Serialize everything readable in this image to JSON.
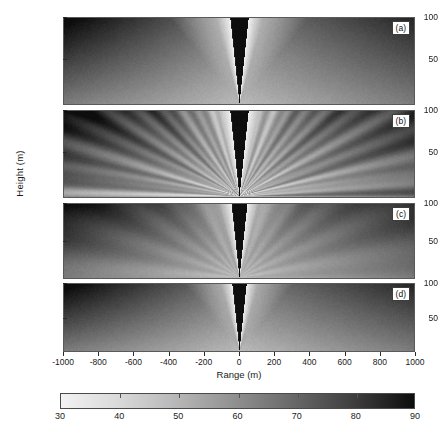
{
  "figure": {
    "type": "multi-panel-pseudocolor",
    "panel_count": 4
  },
  "axes": {
    "xlabel": "Range (m)",
    "ylabel": "Height (m)",
    "xticks": [
      -1000,
      -800,
      -600,
      -400,
      -200,
      0,
      200,
      400,
      600,
      800,
      1000
    ],
    "xlim": [
      -1000,
      1000
    ],
    "yticks": [
      50,
      100
    ],
    "ylim": [
      0,
      110
    ]
  },
  "panels": [
    {
      "label": "(a)",
      "name": "panel-a"
    },
    {
      "label": "(b)",
      "name": "panel-b"
    },
    {
      "label": "(c)",
      "name": "panel-c"
    },
    {
      "label": "(d)",
      "name": "panel-d"
    }
  ],
  "colorbar": {
    "ticks": [
      30,
      40,
      50,
      60,
      70,
      80,
      90
    ],
    "vmin": 30,
    "vmax": 90,
    "colormap": "gray-reversed",
    "low_color": "#f2f2f2",
    "high_color": "#0d0d0d"
  },
  "chart_data": {
    "type": "heatmap",
    "title": "",
    "xlabel": "Range (m)",
    "ylabel": "Height (m)",
    "xlim": [
      -1000,
      1000
    ],
    "ylim": [
      0,
      110
    ],
    "xticks": [
      -1000,
      -800,
      -600,
      -400,
      -200,
      0,
      200,
      400,
      600,
      800,
      1000
    ],
    "yticks": [
      50,
      100
    ],
    "grid": false,
    "legend": "colorbar-below",
    "colorbar": {
      "vmin": 30,
      "vmax": 90,
      "ticks": [
        30,
        40,
        50,
        60,
        70,
        80,
        90
      ],
      "colormap": "gray-reversed",
      "orientation": "horizontal"
    },
    "panels": [
      {
        "label": "(a)",
        "description": "Symmetric V-shaped shadow cone of high values centered at range 0 converging to apex at bottom center; bright low-value lobes flank the cone; values increase with range toward left and right edges; darkest region lower-left.",
        "apex": {
          "range": 0,
          "height": 0
        },
        "cone_half_angle_deg": 6,
        "center_cone_value": 90,
        "bright_lobe_value": 30,
        "far_field_value": 62,
        "texture": "smooth",
        "approx_values": {
          "at_range_-1000_height_100": 58,
          "at_range_-1000_height_10": 86,
          "at_range_-200_height_100": 44,
          "at_range_0_height_100": 90,
          "at_range_200_height_100": 44,
          "at_range_1000_height_100": 58,
          "at_range_1000_height_10": 70
        }
      },
      {
        "label": "(b)",
        "description": "Same V-shaped cone as (a) but with pronounced radial streak/filament texture fanning outward from the apex across the whole field; dark high-value streaks at lower-left and lower-right.",
        "apex": {
          "range": 0,
          "height": 0
        },
        "cone_half_angle_deg": 6,
        "center_cone_value": 90,
        "bright_lobe_value": 30,
        "far_field_value": 60,
        "texture": "radial-streaks",
        "approx_values": {
          "at_range_-1000_height_100": 55,
          "at_range_-1000_height_10": 84,
          "at_range_-200_height_100": 46,
          "at_range_0_height_100": 90,
          "at_range_200_height_100": 46,
          "at_range_1000_height_100": 56,
          "at_range_1000_height_10": 82
        }
      },
      {
        "label": "(c)",
        "description": "Cone with smoother, flatter background than (b); moderate mid-gray field, dark high-value wedge at lower-left and a faint dark streak at lower-right.",
        "apex": {
          "range": 0,
          "height": 0
        },
        "cone_half_angle_deg": 6,
        "center_cone_value": 90,
        "bright_lobe_value": 31,
        "far_field_value": 61,
        "texture": "smooth-mild-streaks",
        "approx_values": {
          "at_range_-1000_height_100": 60,
          "at_range_-1000_height_10": 85,
          "at_range_-200_height_100": 47,
          "at_range_0_height_100": 90,
          "at_range_200_height_100": 47,
          "at_range_1000_height_100": 60,
          "at_range_1000_height_10": 72
        }
      },
      {
        "label": "(d)",
        "description": "Cone similar to (a) and (c); broad dark high-value region at lower-left, faint dark band at lower-right, smooth gradient elsewhere.",
        "apex": {
          "range": 0,
          "height": 0
        },
        "cone_half_angle_deg": 6,
        "center_cone_value": 90,
        "bright_lobe_value": 31,
        "far_field_value": 62,
        "texture": "smooth",
        "approx_values": {
          "at_range_-1000_height_100": 62,
          "at_range_-1000_height_10": 87,
          "at_range_-200_height_100": 46,
          "at_range_0_height_100": 90,
          "at_range_200_height_100": 46,
          "at_range_1000_height_100": 60,
          "at_range_1000_height_10": 74
        }
      }
    ]
  }
}
